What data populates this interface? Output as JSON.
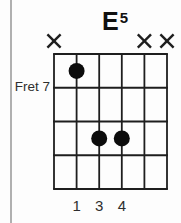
{
  "chord": {
    "root": "E",
    "quality": "5"
  },
  "diagram": {
    "fret_label": "Fret 7",
    "start_fret": 7,
    "strings": 6,
    "frets_shown": 4,
    "muted_symbol": "×",
    "muted_strings": [
      1,
      5,
      6
    ],
    "dots": [
      {
        "string": 2,
        "fret_row": 1,
        "finger": "1"
      },
      {
        "string": 3,
        "fret_row": 3,
        "finger": "3"
      },
      {
        "string": 4,
        "fret_row": 3,
        "finger": "4"
      }
    ]
  },
  "colors": {
    "line": "#1e1e1e",
    "dot": "#0c0c0c",
    "text": "#2e2e2e",
    "title": "#111111",
    "divider": "#b0b0b0",
    "background": "#fdfdfd"
  }
}
